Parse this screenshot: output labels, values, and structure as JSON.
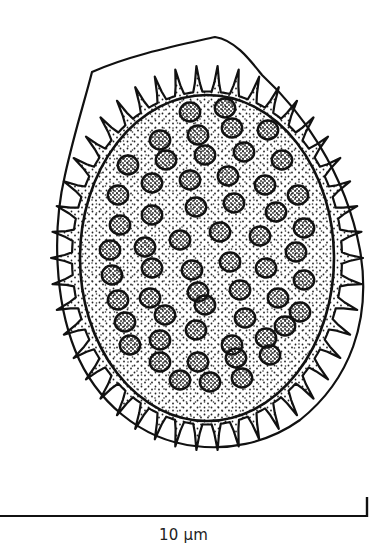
{
  "figure": {
    "colors": {
      "ink": "#111111",
      "paper": "#ffffff",
      "stipple": "#222222"
    },
    "outer_wall": {
      "path": "M 215 37 C 235 40 250 60 262 75 C 300 110 345 170 360 250 C 372 320 350 380 300 420 C 265 445 225 450 195 446 C 140 440 95 400 75 350 C 55 300 52 230 65 175 C 75 130 85 100 92 72 C 130 55 180 45 215 37 Z"
    },
    "inner_body": {
      "cx": 207,
      "cy": 258,
      "rx": 127,
      "ry": 163
    },
    "spiny_layer": {
      "cx": 207,
      "cy": 258,
      "rx": 150,
      "ry": 185,
      "spine_count": 46
    },
    "granules": [
      [
        190,
        112
      ],
      [
        225,
        108
      ],
      [
        160,
        140
      ],
      [
        198,
        135
      ],
      [
        232,
        128
      ],
      [
        268,
        130
      ],
      [
        128,
        165
      ],
      [
        166,
        160
      ],
      [
        205,
        155
      ],
      [
        244,
        152
      ],
      [
        282,
        160
      ],
      [
        118,
        195
      ],
      [
        152,
        183
      ],
      [
        190,
        180
      ],
      [
        228,
        176
      ],
      [
        265,
        185
      ],
      [
        298,
        195
      ],
      [
        120,
        225
      ],
      [
        152,
        215
      ],
      [
        196,
        207
      ],
      [
        234,
        203
      ],
      [
        276,
        212
      ],
      [
        304,
        228
      ],
      [
        110,
        250
      ],
      [
        145,
        247
      ],
      [
        180,
        240
      ],
      [
        220,
        232
      ],
      [
        260,
        236
      ],
      [
        296,
        252
      ],
      [
        112,
        275
      ],
      [
        152,
        268
      ],
      [
        192,
        270
      ],
      [
        230,
        262
      ],
      [
        266,
        268
      ],
      [
        304,
        280
      ],
      [
        118,
        300
      ],
      [
        150,
        298
      ],
      [
        198,
        292
      ],
      [
        240,
        290
      ],
      [
        278,
        298
      ],
      [
        300,
        312
      ],
      [
        125,
        322
      ],
      [
        165,
        315
      ],
      [
        205,
        305
      ],
      [
        245,
        318
      ],
      [
        285,
        326
      ],
      [
        130,
        345
      ],
      [
        160,
        340
      ],
      [
        196,
        330
      ],
      [
        232,
        345
      ],
      [
        266,
        338
      ],
      [
        160,
        362
      ],
      [
        198,
        362
      ],
      [
        236,
        358
      ],
      [
        270,
        355
      ],
      [
        180,
        380
      ],
      [
        210,
        382
      ],
      [
        242,
        378
      ]
    ],
    "granule_rx": 12,
    "granule_ry": 10
  },
  "scale_bar": {
    "label": "10 µm",
    "x1": 0,
    "x2": 367,
    "y": 516,
    "tick_top": 497
  }
}
